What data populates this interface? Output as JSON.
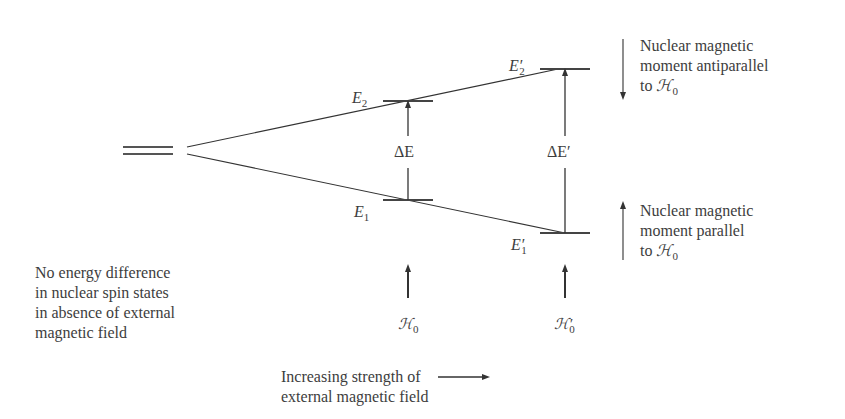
{
  "diagram": {
    "levels": {
      "E1": {
        "symbol": "E",
        "sub": "1",
        "prime": ""
      },
      "E2": {
        "symbol": "E",
        "sub": "2",
        "prime": ""
      },
      "E1p": {
        "symbol": "E",
        "sub": "1",
        "prime": "′"
      },
      "E2p": {
        "symbol": "E",
        "sub": "2",
        "prime": "′"
      }
    },
    "gaps": {
      "dE": "ΔE",
      "dEp": "ΔE′"
    },
    "fields": {
      "H0": {
        "symbol": "ℋ",
        "sub": "0",
        "prime": ""
      },
      "H0p": {
        "symbol": "ℋ",
        "sub": "0",
        "prime": "′"
      }
    },
    "annotations": {
      "antiparallel": {
        "lines": [
          "Nuclear magnetic",
          "moment antiparallel",
          "to "
        ],
        "field_symbol": "ℋ",
        "field_sub": "0",
        "arrow": "down"
      },
      "parallel": {
        "lines": [
          "Nuclear magnetic",
          "moment parallel",
          "to "
        ],
        "field_symbol": "ℋ",
        "field_sub": "0",
        "arrow": "up"
      },
      "no_field": {
        "lines": [
          "No energy difference",
          "in nuclear spin states",
          "in absence of external",
          "magnetic field"
        ]
      },
      "increasing": {
        "lines": [
          "Increasing strength of",
          "external magnetic field"
        ],
        "arrow": "right"
      }
    },
    "colors": {
      "line": "#333333",
      "text": "#3d3d3d",
      "background": "#ffffff"
    }
  }
}
